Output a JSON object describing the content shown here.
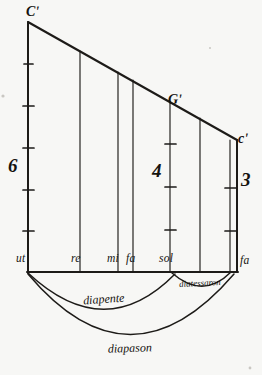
{
  "figure": {
    "ink_color": "#1d1b18",
    "paper_color": "#f7f7f5"
  },
  "pitch_labels": [
    {
      "id": "c-upper-prime",
      "text": "Cʹ",
      "x": 26,
      "y": 16
    },
    {
      "id": "g-prime",
      "text": "Gʹ",
      "x": 168,
      "y": 104
    },
    {
      "id": "c-lower-prime",
      "text": "cʹ",
      "x": 238,
      "y": 143
    }
  ],
  "numerals": [
    {
      "id": "six",
      "text": "6",
      "x": 10,
      "y": 172
    },
    {
      "id": "four",
      "text": "4",
      "x": 153,
      "y": 177
    },
    {
      "id": "three",
      "text": "3",
      "x": 240,
      "y": 186
    }
  ],
  "note_labels": [
    {
      "id": "ut",
      "text": "ut",
      "x": 18,
      "y": 262
    },
    {
      "id": "re",
      "text": "re",
      "x": 72,
      "y": 262
    },
    {
      "id": "mi",
      "text": "mi",
      "x": 110,
      "y": 262
    },
    {
      "id": "fa",
      "text": "fa",
      "x": 128,
      "y": 262
    },
    {
      "id": "sol",
      "text": "sol",
      "x": 162,
      "y": 262
    },
    {
      "id": "fa-high",
      "text": "fa",
      "x": 240,
      "y": 263
    }
  ],
  "interval_arcs": [
    {
      "id": "diapente",
      "text": "diapente",
      "label_x": 104,
      "label_y": 303,
      "rotation": -4
    },
    {
      "id": "diatessaron",
      "text": "diatessaron",
      "label_x": 200,
      "label_y": 285,
      "rotation": -5
    },
    {
      "id": "diapason",
      "text": "diapason",
      "label_x": 128,
      "label_y": 351,
      "rotation": -2
    }
  ],
  "geometry": {
    "apex_x": 28,
    "apex_y": 22,
    "baseline_y": 272,
    "right_x": 237,
    "right_top_y": 140,
    "verticals": [
      {
        "id": "ut",
        "x": 28,
        "top": 22,
        "divisions": 6
      },
      {
        "id": "re",
        "x": 80,
        "top": 57
      },
      {
        "id": "mi",
        "x": 118,
        "top": 83
      },
      {
        "id": "fa",
        "x": 133,
        "top": 93
      },
      {
        "id": "sol",
        "x": 170,
        "top": 118,
        "divisions": 4
      },
      {
        "id": "la",
        "x": 200,
        "top": 138
      },
      {
        "id": "fa-high",
        "x": 230,
        "top": 140,
        "divisions": 3
      }
    ]
  }
}
